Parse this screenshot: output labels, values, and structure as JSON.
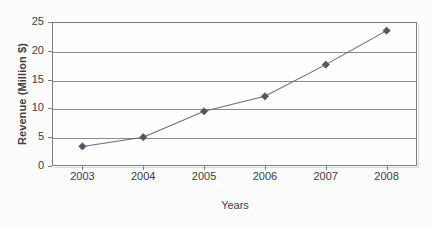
{
  "chart_data": {
    "type": "line",
    "title": "",
    "xlabel": "Years",
    "ylabel": "Revenue (Million $)",
    "categories": [
      "2003",
      "2004",
      "2005",
      "2006",
      "2007",
      "2008"
    ],
    "values": [
      3.4,
      5.0,
      9.5,
      12.1,
      17.6,
      23.5
    ],
    "series": [
      {
        "name": "Revenue",
        "values": [
          3.4,
          5.0,
          9.5,
          12.1,
          17.6,
          23.5
        ]
      }
    ],
    "ylim": [
      0,
      25
    ],
    "yticks": [
      0,
      5,
      10,
      15,
      20,
      25
    ],
    "ytick_labels": [
      "0",
      "5",
      "10",
      "15",
      "20",
      "25"
    ],
    "grid": true,
    "grid_axis": "y",
    "legend": false,
    "legend_position": "none",
    "marker": "diamond",
    "line_color": "#6b6b78",
    "marker_color": "#555566",
    "grid_color": "#8a8a8a",
    "axis_color": "#7d7d7d",
    "plot_background": "#fdfdfd",
    "figure_background": "#fcfcfc",
    "text_color": "#3b3b3b"
  }
}
